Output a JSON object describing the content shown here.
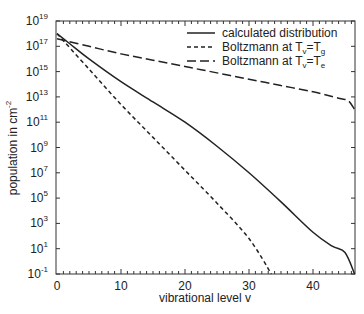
{
  "chart_data": {
    "type": "line",
    "title": "",
    "xlabel": "vibrational level v",
    "ylabel": "population in cm^-2",
    "ylabel_base": "population in cm",
    "ylabel_exp": "-2",
    "xlim": [
      0,
      46.5
    ],
    "ylim": [
      0.1,
      1e+19
    ],
    "yscale": "log",
    "grid": false,
    "legend_position": "upper right",
    "x_ticks": [
      0,
      10,
      20,
      30,
      40
    ],
    "x_tick_labels": [
      "0",
      "10",
      "20",
      "30",
      "40"
    ],
    "y_ticks_exp": [
      19,
      17,
      15,
      13,
      11,
      9,
      7,
      5,
      3,
      1,
      -1
    ],
    "y_tick_labels": [
      "10^19",
      "10^17",
      "10^15",
      "10^13",
      "10^11",
      "10^9",
      "10^7",
      "10^5",
      "10^3",
      "10^1",
      "10^-1"
    ],
    "series": [
      {
        "name": "calculated distribution",
        "legend_label": "calculated distribution",
        "style": "solid",
        "x": [
          0,
          2,
          5,
          10,
          15,
          20,
          25,
          30,
          35,
          40,
          43,
          45,
          46.5
        ],
        "log10_y": [
          18.0,
          17.2,
          16.0,
          14.2,
          12.6,
          11.0,
          9.1,
          7.0,
          4.7,
          2.3,
          1.2,
          0.7,
          -1.0
        ]
      },
      {
        "name": "Boltzmann at Tv=Tg",
        "legend_label": "Boltzmann at T",
        "legend_sub1": "v",
        "legend_mid": "=T",
        "legend_sub2": "g",
        "style": "short-dash",
        "x": [
          0,
          5,
          10,
          15,
          20,
          25,
          30,
          33.5
        ],
        "log10_y": [
          18.0,
          15.2,
          12.4,
          9.8,
          7.2,
          4.6,
          1.8,
          -1.0
        ]
      },
      {
        "name": "Boltzmann at Tv=Te",
        "legend_label": "Boltzmann at T",
        "legend_sub1": "v",
        "legend_mid": "=T",
        "legend_sub2": "e",
        "style": "long-dash",
        "x": [
          0,
          5,
          10,
          15,
          20,
          25,
          30,
          35,
          40,
          44,
          45.5,
          46.5
        ],
        "log10_y": [
          17.6,
          17.0,
          16.4,
          15.9,
          15.4,
          14.9,
          14.4,
          13.9,
          13.4,
          12.9,
          12.7,
          12.0
        ]
      }
    ]
  }
}
